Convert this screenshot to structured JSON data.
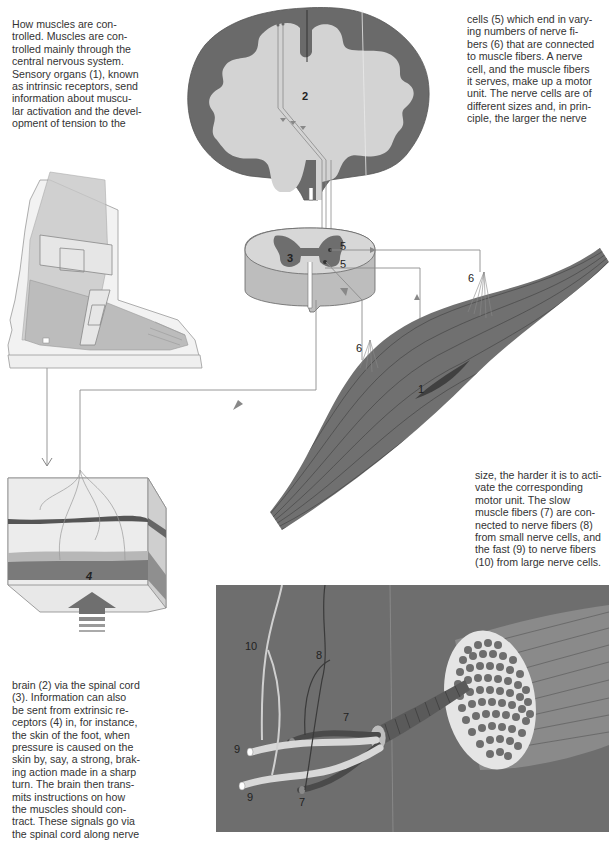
{
  "page": {
    "type": "illustrated-textbook-page",
    "topic": "How muscles are controlled"
  },
  "text_blocks": {
    "intro": {
      "lines": [
        "How muscles are con-",
        "trolled. Muscles are con-",
        "trolled mainly through the",
        "central nervous system.",
        "Sensory organs (1), known",
        "as intrinsic receptors, send",
        "information about muscu-",
        "lar activation and the devel-",
        "opment of tension to the"
      ]
    },
    "continuation_1": {
      "lines": [
        "brain (2) via the spinal cord",
        "(3). Information can also",
        "be sent from extrinsic re-",
        "ceptors (4) in, for instance,",
        "the skin of the foot, when",
        "pressure is caused on the",
        "skin by, say, a strong, brak-",
        "ing action made in a sharp",
        "turn. The brain then trans-",
        "mits instructions on how",
        "the muscles should con-",
        "tract. These signals go via",
        "the spinal cord along nerve"
      ]
    },
    "continuation_2": {
      "lines": [
        "cells (5) which end in vary-",
        "ing numbers of nerve fi-",
        "bers (6) that are connected",
        "to muscle fibers. A nerve",
        "cell, and the muscle fibers",
        "it serves, make up a motor",
        "unit. The nerve cells are of",
        "different sizes and, in prin-",
        "ciple, the larger the nerve"
      ]
    },
    "continuation_3": {
      "lines": [
        "size, the harder it is to acti-",
        "vate the corresponding",
        "motor unit. The slow",
        "muscle fibers (7) are con-",
        "nected to nerve fibers (8)",
        "from small nerve cells, and",
        "the fast (9) to nerve fibers",
        "(10) from large nerve cells."
      ]
    }
  },
  "figure_labels": {
    "brain": "2",
    "spinal_cord": "3",
    "nerve_cell_upper": "5",
    "nerve_cell_lower": "5",
    "nerve_fibers_right": "6",
    "nerve_fibers_left": "6",
    "muscle_receptor": "1",
    "skin_receptor": "4",
    "nerve_fiber_large": "10",
    "nerve_fiber_small": "8",
    "slow_fiber_upper": "7",
    "slow_fiber_lower": "7",
    "fast_fiber_upper": "9",
    "fast_fiber_lower": "9"
  },
  "colors": {
    "gray_matter": "#6b6b6b",
    "white_matter": "#d2d2d2",
    "muscle": "#707070",
    "panel_bg": "#6e6e6e",
    "fiber_light": "#d8d8d8",
    "fiber_dark": "#4a4a4a",
    "skin_layer": "#8a8a8a",
    "line": "#8c8c8c"
  }
}
